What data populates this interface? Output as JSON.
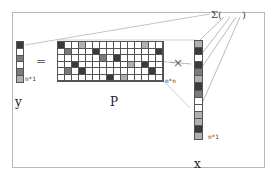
{
  "labels": {
    "y_vector": "y",
    "p_matrix": "P",
    "x_vector": "x",
    "y_dim": "n*1",
    "p_dim": "n*n",
    "x_dim": "n*1",
    "equals": "=",
    "times": "×",
    "sum_expr": "Σ(",
    "sum_inner": "· · ·",
    "sum_close": ")"
  },
  "colors": {
    "white": "#ffffff",
    "light": "#b0b0b0",
    "mid": "#7a7a7a",
    "dark": "#3a3a3a",
    "grid_line": "#555555",
    "frame": "#b8b8b8",
    "connector": "#999999"
  },
  "y_vector_cells": [
    "dark",
    "white",
    "mid",
    "white",
    "mid",
    "light"
  ],
  "x_vector_cells": [
    "light",
    "dark",
    "white",
    "dark",
    "mid",
    "light",
    "dark",
    "mid",
    "white",
    "white",
    "light",
    "light",
    "dark",
    "light"
  ],
  "p_matrix": {
    "rows": 6,
    "cols": 15,
    "cells": [
      [
        "dark",
        "white",
        "white",
        "light",
        "white",
        "white",
        "white",
        "white",
        "white",
        "white",
        "white",
        "white",
        "light",
        "white",
        "white"
      ],
      [
        "white",
        "mid",
        "white",
        "white",
        "white",
        "dark",
        "white",
        "white",
        "white",
        "white",
        "white",
        "white",
        "white",
        "white",
        "dark"
      ],
      [
        "white",
        "white",
        "white",
        "white",
        "white",
        "white",
        "mid",
        "white",
        "dark",
        "white",
        "white",
        "white",
        "white",
        "white",
        "white"
      ],
      [
        "white",
        "white",
        "dark",
        "white",
        "white",
        "white",
        "white",
        "white",
        "white",
        "white",
        "light",
        "white",
        "dark",
        "white",
        "white"
      ],
      [
        "white",
        "mid",
        "white",
        "dark",
        "white",
        "white",
        "white",
        "white",
        "white",
        "white",
        "white",
        "white",
        "white",
        "dark",
        "white"
      ],
      [
        "white",
        "white",
        "white",
        "white",
        "white",
        "white",
        "white",
        "dark",
        "white",
        "light",
        "white",
        "white",
        "white",
        "white",
        "white"
      ]
    ]
  }
}
